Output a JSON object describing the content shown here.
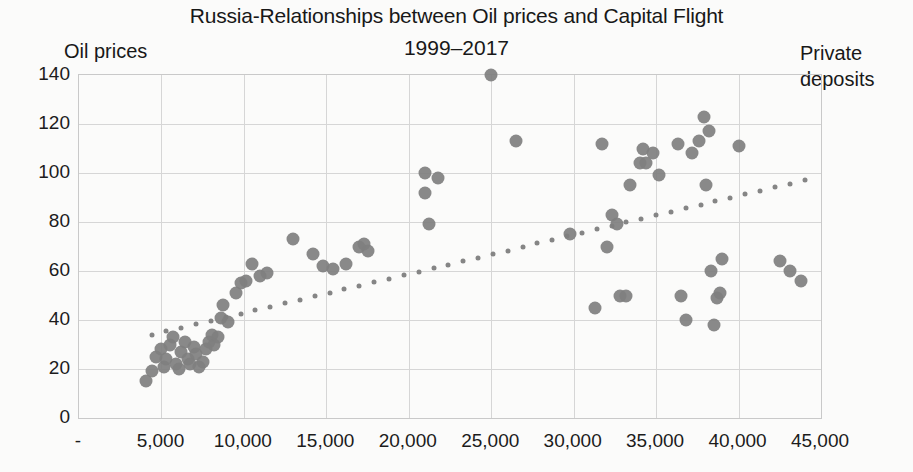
{
  "chart_data": {
    "type": "scatter",
    "title": "Russia-Relationships between Oil prices and Capital Flight",
    "subtitle": "1999–2017",
    "xlabel": "Private deposits",
    "ylabel": "Oil prices",
    "xlim": [
      0,
      45000
    ],
    "ylim": [
      0,
      140
    ],
    "xticks": [
      "-",
      "5,000",
      "10,000",
      "15,000",
      "20,000",
      "25,000",
      "30,000",
      "35,000",
      "40,000",
      "45,000"
    ],
    "xtick_values": [
      0,
      5000,
      10000,
      15000,
      20000,
      25000,
      30000,
      35000,
      40000,
      45000
    ],
    "yticks": [
      "0",
      "20",
      "40",
      "60",
      "80",
      "100",
      "120",
      "140"
    ],
    "ytick_values": [
      0,
      20,
      40,
      60,
      80,
      100,
      120,
      140
    ],
    "grid": true,
    "legend": "none",
    "marker_color": "#7f7f7f",
    "trendline_color": "#858585",
    "grid_color": "#d6d6d6",
    "series": [
      {
        "name": "Oil prices vs Private deposits",
        "points": [
          [
            4050,
            15
          ],
          [
            4450,
            19
          ],
          [
            4700,
            25
          ],
          [
            4950,
            28
          ],
          [
            5150,
            21
          ],
          [
            5300,
            24
          ],
          [
            5500,
            30
          ],
          [
            5700,
            33
          ],
          [
            5900,
            22
          ],
          [
            6050,
            20
          ],
          [
            6200,
            27
          ],
          [
            6400,
            31
          ],
          [
            6600,
            24
          ],
          [
            6750,
            22
          ],
          [
            6950,
            29
          ],
          [
            7100,
            26
          ],
          [
            7300,
            21
          ],
          [
            7500,
            23
          ],
          [
            7700,
            28
          ],
          [
            7900,
            31
          ],
          [
            8050,
            34
          ],
          [
            8200,
            30
          ],
          [
            8400,
            33
          ],
          [
            8600,
            41
          ],
          [
            8750,
            46
          ],
          [
            9050,
            39
          ],
          [
            9500,
            51
          ],
          [
            9800,
            55
          ],
          [
            10100,
            56
          ],
          [
            10500,
            63
          ],
          [
            11000,
            58
          ],
          [
            11400,
            59
          ],
          [
            13000,
            73
          ],
          [
            14200,
            67
          ],
          [
            14800,
            62
          ],
          [
            15400,
            61
          ],
          [
            16200,
            63
          ],
          [
            17000,
            70
          ],
          [
            17300,
            71
          ],
          [
            17500,
            68
          ],
          [
            21000,
            100
          ],
          [
            21000,
            92
          ],
          [
            21200,
            79
          ],
          [
            21800,
            98
          ],
          [
            25000,
            140
          ],
          [
            26500,
            113
          ],
          [
            29800,
            75
          ],
          [
            31300,
            45
          ],
          [
            31700,
            112
          ],
          [
            32000,
            70
          ],
          [
            32300,
            83
          ],
          [
            32600,
            79
          ],
          [
            32800,
            50
          ],
          [
            33200,
            50
          ],
          [
            33400,
            95
          ],
          [
            34000,
            104
          ],
          [
            34200,
            110
          ],
          [
            34400,
            104
          ],
          [
            34800,
            108
          ],
          [
            35200,
            99
          ],
          [
            36300,
            112
          ],
          [
            36500,
            50
          ],
          [
            36800,
            40
          ],
          [
            37200,
            108
          ],
          [
            37600,
            113
          ],
          [
            37900,
            123
          ],
          [
            38000,
            95
          ],
          [
            38200,
            117
          ],
          [
            38300,
            60
          ],
          [
            38500,
            38
          ],
          [
            38700,
            49
          ],
          [
            38900,
            51
          ],
          [
            39000,
            65
          ],
          [
            40000,
            111
          ],
          [
            42500,
            64
          ],
          [
            43100,
            60
          ],
          [
            43800,
            56
          ]
        ]
      }
    ],
    "trendline": {
      "type": "dotted-linear",
      "x_start": 4400,
      "y_start": 34,
      "x_end": 44000,
      "y_end": 97
    }
  }
}
